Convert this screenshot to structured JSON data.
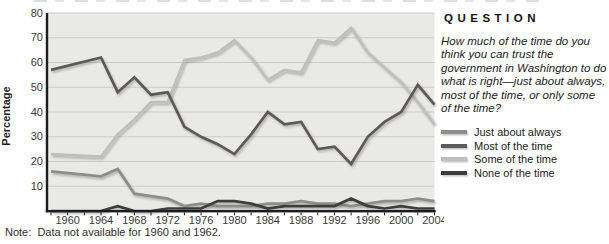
{
  "page": {
    "note": "Note:  Data not available for 1960 and 1962."
  },
  "question_panel": {
    "heading": "QUESTION",
    "question": "How much of the time do you think you can trust the government in Washington to do what is right—just about always, most of the time, or only some of the time?"
  },
  "chart_data": {
    "type": "line",
    "title": "",
    "xlabel": "",
    "ylabel": "Percentage",
    "ylim": [
      0,
      80
    ],
    "ytick_step": 10,
    "grid": true,
    "legend_position": "right-panel",
    "plot_bg_color": "#e9e9e7",
    "grid_color": "#cbcbc9",
    "axis_color": "#1c1c1c",
    "tick_label_color": "#3a3a3a",
    "xtick_labels": [
      1960,
      1964,
      1968,
      1972,
      1976,
      1980,
      1984,
      1988,
      1992,
      1996,
      2000,
      2004
    ],
    "minor_tick_years_step": 2,
    "x": [
      1958,
      1964,
      1966,
      1968,
      1970,
      1972,
      1974,
      1976,
      1978,
      1980,
      1982,
      1984,
      1986,
      1988,
      1990,
      1992,
      1994,
      1996,
      1998,
      2000,
      2002,
      2004
    ],
    "series": [
      {
        "name": "Just about always",
        "color": "#8d8d8b",
        "values": [
          16,
          14,
          17,
          7,
          6,
          5,
          2,
          3,
          2,
          2,
          2,
          3,
          3,
          4,
          3,
          3,
          2,
          3,
          4,
          4,
          5,
          4
        ]
      },
      {
        "name": "Most of the time",
        "color": "#5e595a",
        "values": [
          57,
          62,
          48,
          54,
          47,
          48,
          34,
          30,
          27,
          23,
          31,
          40,
          35,
          36,
          25,
          26,
          19,
          30,
          36,
          40,
          51,
          43
        ]
      },
      {
        "name": "Some of the time",
        "color": "#bfbfbd",
        "values": [
          23,
          22,
          31,
          37,
          44,
          44,
          61,
          62,
          64,
          69,
          62,
          53,
          57,
          56,
          69,
          68,
          74,
          64,
          58,
          52,
          44,
          35
        ]
      },
      {
        "name": "None of the time",
        "color": "#3d3c3e",
        "values": [
          0,
          0,
          2,
          0,
          0,
          1,
          1,
          1,
          4,
          4,
          3,
          1,
          2,
          2,
          2,
          2,
          5,
          2,
          1,
          2,
          1,
          1
        ]
      }
    ],
    "draw_order": [
      2,
      0,
      3,
      1
    ]
  }
}
